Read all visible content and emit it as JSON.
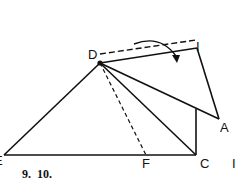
{
  "figure": {
    "caption": "9.  10.",
    "points": {
      "D": "D",
      "I": "I",
      "A": "A",
      "C": "C",
      "F": "F",
      "E": "E"
    },
    "edge_mark": "I"
  },
  "colors": {
    "stroke": "#111111",
    "background": "#ffffff"
  }
}
